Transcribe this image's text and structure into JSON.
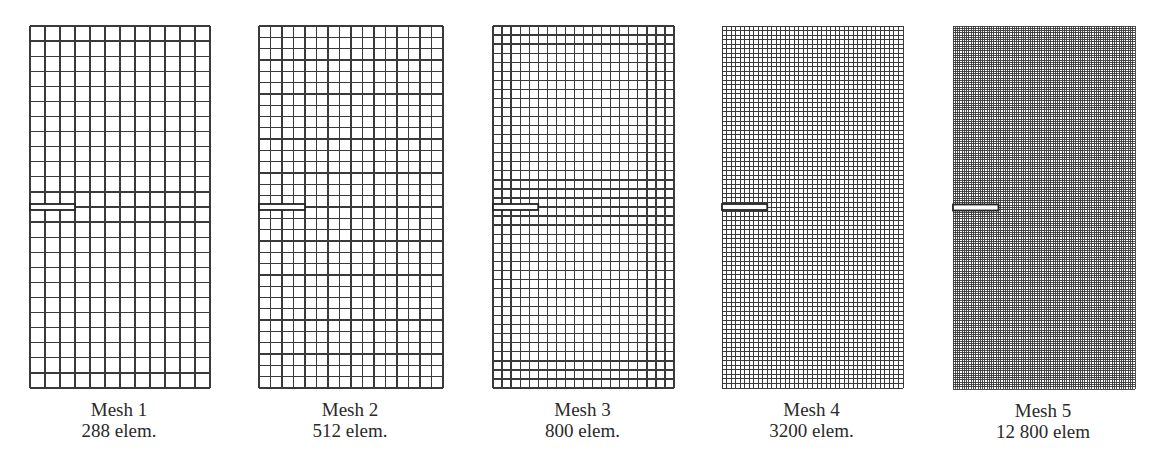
{
  "figure": {
    "meshes": [
      {
        "title": "Mesh 1",
        "elements_label": "288 elem.",
        "elements": 288,
        "cols": 12,
        "rows": 24,
        "box": {
          "x": 29,
          "y": 25,
          "w": 180,
          "h": 362
        }
      },
      {
        "title": "Mesh 2",
        "elements_label": "512 elem.",
        "elements": 512,
        "cols": 16,
        "rows": 32,
        "box": {
          "x": 258,
          "y": 25,
          "w": 184,
          "h": 362
        }
      },
      {
        "title": "Mesh 3",
        "elements_label": "800 elem.",
        "elements": 800,
        "cols": 20,
        "rows": 40,
        "box": {
          "x": 492,
          "y": 25,
          "w": 181,
          "h": 362
        }
      },
      {
        "title": "Mesh 4",
        "elements_label": "3200 elem.",
        "elements": 3200,
        "cols": 40,
        "rows": 80,
        "box": {
          "x": 721,
          "y": 25,
          "w": 181,
          "h": 362
        }
      },
      {
        "title": "Mesh 5",
        "elements_label": "12 800 elem",
        "elements": 12800,
        "cols": 80,
        "rows": 160,
        "box": {
          "x": 952,
          "y": 25,
          "w": 182,
          "h": 363
        }
      }
    ],
    "crack": {
      "relative_length": 0.25,
      "relative_height_position": 0.5
    },
    "colors": {
      "grid_line": "#3a3a3a",
      "background": "#ffffff",
      "crack_fill": "#ffffff",
      "crack_outline": "#222222"
    }
  }
}
